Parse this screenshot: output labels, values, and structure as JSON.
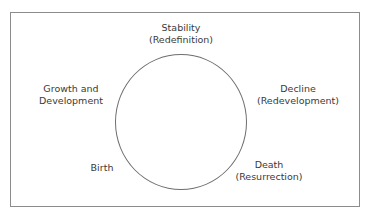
{
  "diagram": {
    "type": "cycle",
    "nodes": [
      {
        "id": "stability",
        "line1": "Stability",
        "line2": "(Redefinition)"
      },
      {
        "id": "decline",
        "line1": "Decline",
        "line2": "(Redevelopment)"
      },
      {
        "id": "death",
        "line1": "Death",
        "line2": "(Resurrection)"
      },
      {
        "id": "birth",
        "line1": "Birth"
      },
      {
        "id": "growth",
        "line1": "Growth and",
        "line2": "Development"
      }
    ]
  }
}
